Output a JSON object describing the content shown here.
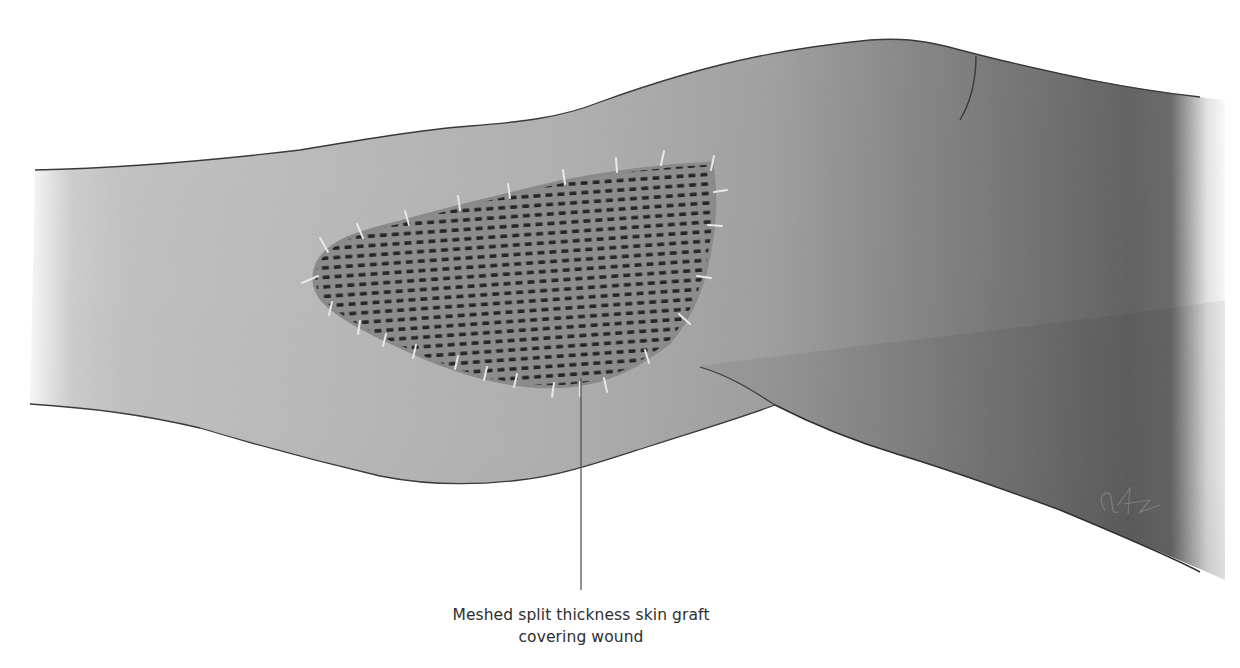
{
  "figure": {
    "annotation": {
      "line1": "Meshed split thickness skin graft",
      "line2": "covering wound"
    },
    "colors": {
      "background": "#ffffff",
      "skin_light": "#c4c4c4",
      "skin_mid": "#a8a8a8",
      "skin_dark": "#6a6a6a",
      "outline": "#3a3a3a",
      "graft_base": "#8e8e8e",
      "graft_holes": "#2a2a2a",
      "staples": "#e6e6e6",
      "leader_line": "#555555",
      "label_text": "#2e2e2e"
    },
    "elements": [
      {
        "name": "thigh",
        "type": "anatomy"
      },
      {
        "name": "lower-leg",
        "type": "anatomy"
      },
      {
        "name": "knee-crease",
        "type": "anatomy-line"
      },
      {
        "name": "meshed-graft",
        "type": "graft"
      },
      {
        "name": "staples",
        "type": "fixation",
        "count": 30
      },
      {
        "name": "leader-line",
        "type": "callout"
      },
      {
        "name": "artist-signature",
        "type": "signature"
      }
    ]
  }
}
